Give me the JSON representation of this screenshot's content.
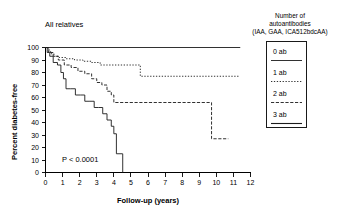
{
  "panel": {
    "title": "All relatives",
    "pvalue": "P < 0.0001"
  },
  "legend": {
    "title_line1": "Number of",
    "title_line2": "autoantibodies",
    "title_line3": "(IAA, GAA, ICA512bdcAA)",
    "entries": [
      {
        "label": "0 ab",
        "style": "solid"
      },
      {
        "label": "1 ab",
        "style": "dotted"
      },
      {
        "label": "2 ab",
        "style": "dash-dot"
      },
      {
        "label": "3 ab",
        "style": "solid-thick"
      }
    ]
  },
  "axes": {
    "x_label": "Follow-up (years)",
    "y_label": "Percent diabetes-free",
    "x_ticks": [
      "0",
      "1",
      "2",
      "3",
      "4",
      "5",
      "6",
      "7",
      "8",
      "9",
      "10",
      "11",
      "12"
    ],
    "y_ticks": [
      "0",
      "10",
      "20",
      "30",
      "40",
      "50",
      "60",
      "70",
      "80",
      "90",
      "100"
    ]
  },
  "chart_data": {
    "type": "line",
    "title": "All relatives",
    "subtitle": "",
    "xlabel": "Follow-up (years)",
    "ylabel": "Percent diabetes-free",
    "xlim": [
      0,
      12
    ],
    "ylim": [
      0,
      100
    ],
    "xticks": [
      0,
      1,
      2,
      3,
      4,
      5,
      6,
      7,
      8,
      9,
      10,
      11,
      12
    ],
    "yticks": [
      0,
      10,
      20,
      30,
      40,
      50,
      60,
      70,
      80,
      90,
      100
    ],
    "grid": false,
    "legend_position": "right-outside",
    "legend_title": "Number of autoantibodies (IAA, GAA, ICA512bdcAA)",
    "annotations": [
      {
        "text": "P < 0.0001",
        "x": 1.0,
        "y": 14
      },
      {
        "text": "All relatives",
        "x": 0.6,
        "y": 112
      }
    ],
    "step_type": "post",
    "series": [
      {
        "name": "0 ab",
        "style": "solid",
        "x": [
          0,
          11.4
        ],
        "y": [
          100,
          100
        ],
        "points": [
          [
            0,
            100
          ],
          [
            11.4,
            100
          ]
        ]
      },
      {
        "name": "1 ab",
        "style": "dotted",
        "x": [
          0,
          0.15,
          0.3,
          0.5,
          0.8,
          1.2,
          1.7,
          2.2,
          2.7,
          3.2,
          4.3,
          5.55,
          11.3
        ],
        "y": [
          100,
          97,
          95,
          93,
          92,
          91,
          90,
          89,
          88,
          86,
          86,
          77,
          77
        ],
        "points": [
          [
            0,
            100
          ],
          [
            0.15,
            97
          ],
          [
            0.3,
            95
          ],
          [
            0.5,
            93
          ],
          [
            0.8,
            92
          ],
          [
            1.2,
            91
          ],
          [
            1.7,
            90
          ],
          [
            2.2,
            89
          ],
          [
            2.7,
            88
          ],
          [
            3.2,
            86
          ],
          [
            4.3,
            86
          ],
          [
            5.55,
            77
          ],
          [
            11.3,
            77
          ]
        ]
      },
      {
        "name": "2 ab",
        "style": "dash-dot",
        "x": [
          0,
          0.2,
          0.45,
          0.75,
          1.1,
          1.5,
          1.9,
          2.3,
          2.7,
          3.0,
          3.3,
          3.6,
          3.85,
          4.0,
          9.7,
          9.72,
          10.7
        ],
        "y": [
          100,
          96,
          93,
          90,
          86,
          84,
          81,
          79,
          75,
          72,
          70,
          65,
          62,
          56,
          56,
          27,
          27
        ],
        "points": [
          [
            0,
            100
          ],
          [
            0.2,
            96
          ],
          [
            0.45,
            93
          ],
          [
            0.75,
            90
          ],
          [
            1.1,
            86
          ],
          [
            1.5,
            84
          ],
          [
            1.9,
            81
          ],
          [
            2.3,
            79
          ],
          [
            2.7,
            75
          ],
          [
            3.0,
            72
          ],
          [
            3.3,
            70
          ],
          [
            3.6,
            65
          ],
          [
            3.85,
            62
          ],
          [
            4.0,
            56
          ],
          [
            9.7,
            56
          ],
          [
            9.72,
            27
          ],
          [
            10.7,
            27
          ]
        ]
      },
      {
        "name": "3 ab",
        "style": "solid",
        "x": [
          0,
          0.1,
          0.25,
          0.45,
          0.7,
          0.9,
          1.05,
          1.2,
          1.45,
          1.75,
          2.05,
          2.3,
          2.6,
          2.85,
          3.1,
          3.35,
          3.6,
          3.85,
          4.0,
          4.15,
          4.5,
          4.52
        ],
        "y": [
          100,
          96,
          93,
          88,
          86,
          80,
          75,
          67,
          67,
          62,
          62,
          57,
          57,
          52,
          52,
          47,
          42,
          37,
          31,
          15,
          15,
          0
        ],
        "points": [
          [
            0,
            100
          ],
          [
            0.1,
            96
          ],
          [
            0.25,
            93
          ],
          [
            0.45,
            88
          ],
          [
            0.7,
            86
          ],
          [
            0.9,
            80
          ],
          [
            1.05,
            75
          ],
          [
            1.2,
            67
          ],
          [
            1.45,
            67
          ],
          [
            1.75,
            62
          ],
          [
            2.05,
            62
          ],
          [
            2.3,
            57
          ],
          [
            2.6,
            57
          ],
          [
            2.85,
            52
          ],
          [
            3.1,
            52
          ],
          [
            3.35,
            47
          ],
          [
            3.6,
            42
          ],
          [
            3.85,
            37
          ],
          [
            4.0,
            31
          ],
          [
            4.15,
            15
          ],
          [
            4.5,
            15
          ],
          [
            4.52,
            0
          ]
        ]
      }
    ]
  }
}
